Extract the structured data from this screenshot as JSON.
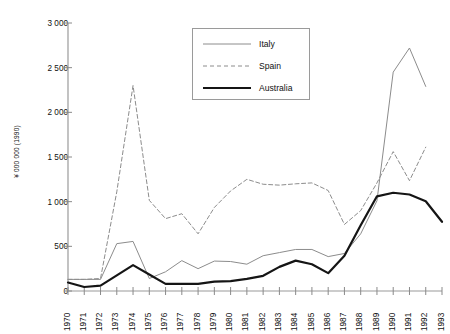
{
  "chart_data": {
    "type": "line",
    "title": "",
    "xlabel": "",
    "ylabel": "¥ 000 000 (1990)",
    "xlim": [
      1970,
      1993
    ],
    "ylim": [
      0,
      3000
    ],
    "ytick_step": 500,
    "grid": false,
    "legend_position": "top-center",
    "categories": [
      "1970",
      "1971",
      "1972",
      "1973",
      "1974",
      "1975",
      "1976",
      "1977",
      "1978",
      "1979",
      "1980",
      "1981",
      "1982",
      "1983",
      "1984",
      "1985",
      "1986",
      "1987",
      "1988",
      "1989",
      "1990",
      "1991",
      "1992",
      "1993"
    ],
    "ytick_labels": [
      "0",
      "500",
      "1 000",
      "1 500",
      "2 000",
      "2 500",
      "3 000"
    ],
    "ytick_values": [
      0,
      500,
      1000,
      1500,
      2000,
      2500,
      3000
    ],
    "series": [
      {
        "name": "Italy",
        "style": "thin-solid",
        "color": "#8c8c8c",
        "values": [
          130,
          130,
          130,
          530,
          555,
          140,
          215,
          340,
          250,
          335,
          330,
          300,
          395,
          430,
          465,
          465,
          385,
          420,
          640,
          1010,
          2450,
          2720,
          2290,
          null
        ]
      },
      {
        "name": "Spain",
        "style": "dashed",
        "color": "#8c8c8c",
        "values": [
          130,
          130,
          140,
          1110,
          2300,
          1015,
          810,
          865,
          640,
          935,
          1120,
          1250,
          1195,
          1185,
          1200,
          1210,
          1125,
          745,
          900,
          1210,
          1560,
          1235,
          1610,
          null
        ]
      },
      {
        "name": "Australia",
        "style": "thick-solid",
        "color": "#151515",
        "values": [
          95,
          45,
          60,
          175,
          290,
          185,
          80,
          80,
          80,
          105,
          110,
          135,
          170,
          270,
          340,
          300,
          200,
          395,
          735,
          1060,
          1100,
          1080,
          1005,
          775
        ]
      }
    ]
  },
  "legend": {
    "items": [
      {
        "label": "Italy"
      },
      {
        "label": "Spain"
      },
      {
        "label": "Australia"
      }
    ]
  }
}
